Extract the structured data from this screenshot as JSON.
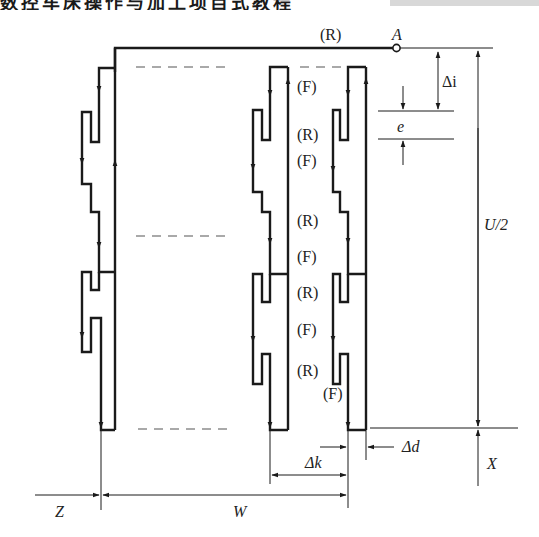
{
  "heading": {
    "text": "数控车床操作与加工项目式教程"
  },
  "diagram": {
    "point_label": "A",
    "motion_labels": {
      "top_R": "(R)",
      "mid": [
        "(F)",
        "(R)",
        "(F)",
        "(R)",
        "(F)",
        "(R)",
        "(F)",
        "(R)"
      ],
      "last_F": "(F)"
    },
    "dimensions": {
      "delta_i": "Δi",
      "e": "e",
      "u_half": "U/2",
      "delta_d": "Δd",
      "delta_k": "Δk",
      "x": "X",
      "z": "Z",
      "w": "W"
    },
    "colors": {
      "stroke": "#1a1a1a",
      "dash": "#555555"
    }
  }
}
